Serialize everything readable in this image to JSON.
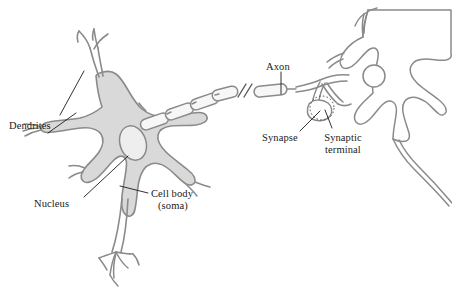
{
  "figure": {
    "type": "biological-diagram",
    "background_color": "#ffffff",
    "membrane_outline_color": "#8a8a8a",
    "soma_fill_color": "#d9d9d9",
    "nucleus_fill_color": "#eaeaea",
    "myelin_fill_color": "#f2f2f2",
    "label_text_color": "#1a1a1a",
    "leader_line_color": "#1a1a1a"
  },
  "labels": {
    "dendrites": "Dendrites",
    "nucleus": "Nucleus",
    "cell_body_line1": "Cell body",
    "cell_body_line2": "(soma)",
    "axon": "Axon",
    "synapse": "Synapse",
    "synaptic_terminal_line1": "Synaptic",
    "synaptic_terminal_line2": "terminal"
  },
  "parts": [
    {
      "name": "dendrites",
      "belongs_to": "presynaptic-neuron"
    },
    {
      "name": "nucleus",
      "belongs_to": "presynaptic-neuron"
    },
    {
      "name": "cell-body-soma",
      "belongs_to": "presynaptic-neuron"
    },
    {
      "name": "axon",
      "belongs_to": "presynaptic-neuron"
    },
    {
      "name": "myelin-sheath",
      "belongs_to": "presynaptic-neuron"
    },
    {
      "name": "axon-break-symbol",
      "belongs_to": "presynaptic-neuron"
    },
    {
      "name": "synaptic-terminal",
      "belongs_to": "presynaptic-neuron"
    },
    {
      "name": "synapse",
      "belongs_to": "junction"
    },
    {
      "name": "postsynaptic-neuron",
      "belongs_to": "postsynaptic-neuron"
    }
  ]
}
